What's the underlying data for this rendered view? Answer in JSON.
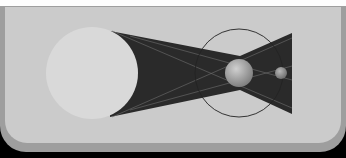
{
  "diagram": {
    "colors": {
      "background": "#cbcbcb",
      "frame": "#9e9e9e",
      "shadow_cone": "#2a2a2a",
      "sun": "#d9d9d9",
      "orbit": "#222222",
      "earth": "#9a9a9a",
      "moon": "#8c8c8c",
      "rays": "#6e6e6e"
    },
    "elements": [
      {
        "id": "sun",
        "label": "Sun",
        "cx": 92,
        "cy": 73,
        "r": 46
      },
      {
        "id": "earth",
        "label": "Earth",
        "cx": 239,
        "cy": 73,
        "r": 14
      },
      {
        "id": "moon",
        "label": "Moon",
        "cx": 281,
        "cy": 73,
        "r": 6
      },
      {
        "id": "moon-orbit",
        "label": "Moon orbit",
        "cx": 239,
        "cy": 73,
        "r": 44
      }
    ]
  }
}
